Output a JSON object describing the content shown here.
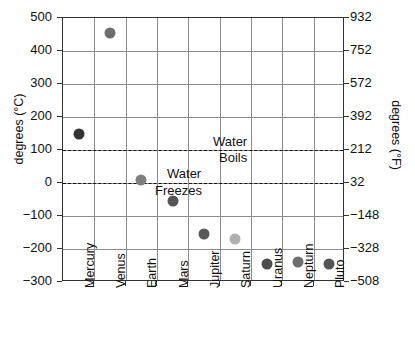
{
  "chart_data": {
    "type": "scatter",
    "title": "",
    "categories": [
      "Mercury",
      "Venus",
      "Earth",
      "Mars",
      "Jupiter",
      "Saturn",
      "Uranus",
      "Nepturn",
      "Pluto"
    ],
    "values": [
      150,
      455,
      10,
      -55,
      -155,
      -170,
      -245,
      -240,
      -245
    ],
    "series": [
      {
        "name": "Planet surface temperature",
        "values": [
          150,
          455,
          10,
          -55,
          -155,
          -170,
          -245,
          -240,
          -245
        ]
      }
    ],
    "point_colors": [
      "#333333",
      "#6e6e6e",
      "#808080",
      "#555555",
      "#5a5a5a",
      "#b0b0b0",
      "#4d4d4d",
      "#6e6e6e",
      "#555555"
    ],
    "xlabel": "",
    "ylabel": "degrees (°C)",
    "ylabel_right": "degrees (°F)",
    "ylim": [
      -300,
      500
    ],
    "ylim_right": [
      -508,
      932
    ],
    "yticks": [
      500,
      400,
      300,
      200,
      100,
      0,
      -100,
      -200,
      -300
    ],
    "ytick_labels": [
      "500",
      "400",
      "300",
      "200",
      "100",
      "0",
      "−100",
      "−200",
      "−300"
    ],
    "yticks_right": [
      932,
      752,
      572,
      392,
      212,
      32,
      -148,
      -328,
      -508
    ],
    "ytick_labels_right": [
      "932",
      "752",
      "572",
      "392",
      "212",
      "32",
      "−148",
      "−328",
      "−508"
    ],
    "grid": true,
    "legend": "none",
    "reference_lines": [
      {
        "value": 100,
        "label": "Water Boils",
        "style": "dashed"
      },
      {
        "value": 0,
        "label": "Water Freezes",
        "style": "dashed"
      }
    ],
    "annotations": [
      {
        "id": "water",
        "text": "Water",
        "at_value": 125
      },
      {
        "id": "boils",
        "text": "Boils",
        "at_value": 75
      },
      {
        "id": "water2",
        "text": "Water",
        "at_value": 28
      },
      {
        "id": "freezes",
        "text": "Freezes",
        "at_value": -25
      }
    ],
    "colors": {
      "grid": "#8c8c8c",
      "frame": "#333333",
      "text": "#111111",
      "refline": "#111111",
      "background": "#ffffff"
    }
  },
  "annotations": {
    "water_boils_line1": "Water",
    "water_boils_line2": "Boils",
    "water_freezes_line1": "Water",
    "water_freezes_line2": "Freezes"
  },
  "axes": {
    "left_title": "degrees (°C)",
    "right_title": "degrees (°F)"
  }
}
